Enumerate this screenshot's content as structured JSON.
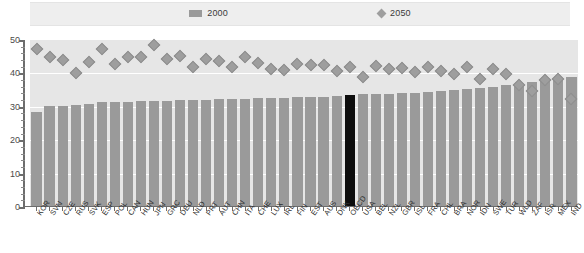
{
  "legend": {
    "items": [
      {
        "label": "2000",
        "marker": "bar-swatch-icon",
        "color": "#9a9a9a"
      },
      {
        "label": "2050",
        "marker": "diamond-swatch-icon",
        "color": "#9e9e9e"
      }
    ]
  },
  "axis": {
    "y_ticks": [
      "0",
      "10",
      "20",
      "30",
      "40",
      "50"
    ]
  },
  "colors": {
    "bar_2000": "#9a9a9a",
    "marker_2050": "#9e9e9e",
    "highlight_bar": "#0d0d0d",
    "plot_background": "#e6e6e6",
    "gridline": "#ffffff",
    "legend_band": "#eeeeee"
  },
  "chart_data": {
    "type": "bar",
    "title": "",
    "subtitle": "",
    "xlabel": "",
    "ylabel": "",
    "ylim": [
      0,
      50
    ],
    "ytick_interval": 10,
    "minor_tick_interval": 2,
    "grid": true,
    "legend_position": "top",
    "highlight_category": "OECD",
    "categories": [
      "KOR",
      "SVN",
      "CZE",
      "RUS",
      "SVK",
      "ESP",
      "POL",
      "CAN",
      "HUN",
      "JPN",
      "GRC",
      "DEU",
      "NLD",
      "PRT",
      "AUT",
      "CHN",
      "ITA",
      "CHE",
      "LUX",
      "IRL",
      "FIN",
      "EST",
      "AUS",
      "DNK",
      "OECD",
      "USA",
      "BEL",
      "NZL",
      "GBR",
      "ISL",
      "FRA",
      "CHL",
      "BRA",
      "NOR",
      "IDN",
      "SWE",
      "TUR",
      "WLD",
      "ZAF",
      "ISR",
      "MEX",
      "IND"
    ],
    "series": [
      {
        "name": "2000",
        "type": "bar",
        "values": [
          28.3,
          30.2,
          30.3,
          30.6,
          30.9,
          31.3,
          31.4,
          31.5,
          31.6,
          31.7,
          31.8,
          31.9,
          32.0,
          32.1,
          32.2,
          32.3,
          32.4,
          32.5,
          32.6,
          32.7,
          32.8,
          32.9,
          33.0,
          33.2,
          33.5,
          33.7,
          33.8,
          33.9,
          34.0,
          34.2,
          34.4,
          34.6,
          35.0,
          35.3,
          35.6,
          36.0,
          36.4,
          36.8,
          37.4,
          38.0,
          38.5,
          39.0
        ]
      },
      {
        "name": "2050",
        "type": "scatter",
        "marker": "diamond",
        "values": [
          47.3,
          45.0,
          44.1,
          40.2,
          43.5,
          47.2,
          42.7,
          44.8,
          44.9,
          48.4,
          44.4,
          45.2,
          42.0,
          44.2,
          43.8,
          41.9,
          44.8,
          43.2,
          41.3,
          41.1,
          42.8,
          42.6,
          42.4,
          40.6,
          42.0,
          39.0,
          42.3,
          41.3,
          41.6,
          40.4,
          42.0,
          40.6,
          39.7,
          41.8,
          38.4,
          41.2,
          39.8,
          36.5,
          34.7,
          38.0,
          38.2,
          32.4
        ]
      }
    ]
  }
}
